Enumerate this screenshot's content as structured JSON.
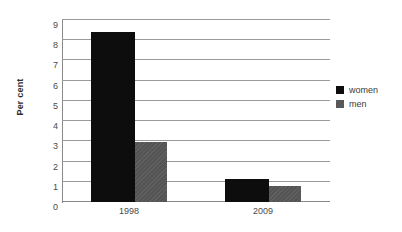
{
  "chart_data": {
    "type": "bar",
    "title": "",
    "subtitle": "",
    "xlabel": "",
    "ylabel": "Per cent",
    "categories": [
      "1998",
      "2009"
    ],
    "series": [
      {
        "name": "women",
        "color": "#0d0d0d",
        "values": [
          8.4,
          1.15
        ]
      },
      {
        "name": "men",
        "color": "#595959",
        "values": [
          2.95,
          0.8
        ]
      }
    ],
    "ylim": [
      0,
      9
    ],
    "ytick_step": 1,
    "yticks": [
      0,
      1,
      2,
      3,
      4,
      5,
      6,
      7,
      8,
      9
    ],
    "ytick_labels": [
      "0",
      "1",
      "2",
      "3",
      "4",
      "5",
      "6",
      "7",
      "8",
      "9"
    ],
    "grid": true,
    "grid_axis": "y",
    "legend": true,
    "legend_position": "right",
    "background_color": "#ffffff",
    "grid_color": "#9a9a9a",
    "axis_color": "#8a8a8a",
    "text_color": "#3a3a3a"
  },
  "legend_entries": [
    {
      "label": "women",
      "swatch_class": "women"
    },
    {
      "label": "men",
      "swatch_class": "men"
    }
  ]
}
